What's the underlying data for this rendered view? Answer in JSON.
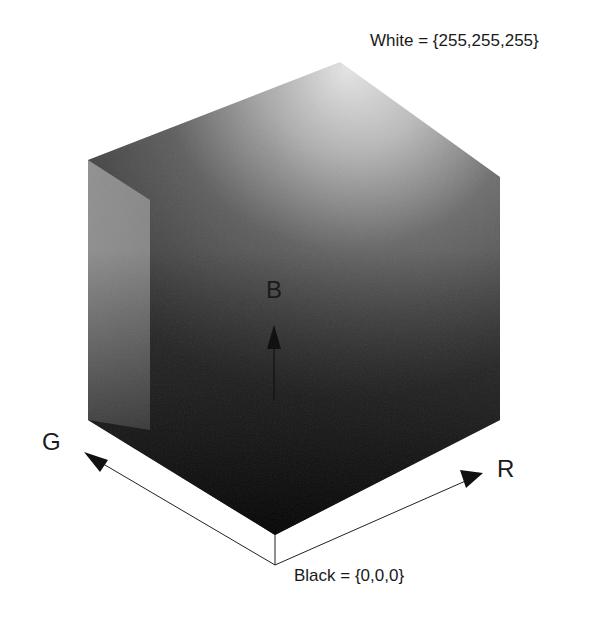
{
  "diagram": {
    "type": "rgb-color-cube",
    "corner_labels": {
      "white": "White = {255,255,255}",
      "black": "Black = {0,0,0}"
    },
    "axes": {
      "r": "R",
      "g": "G",
      "b": "B"
    },
    "colors": {
      "background": "#ffffff",
      "cube_light": "#f4f4f4",
      "cube_mid": "#7a7a7a",
      "cube_dark": "#0a0a0a",
      "line": "#222222"
    }
  }
}
